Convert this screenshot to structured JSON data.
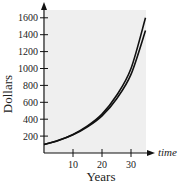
{
  "chart_data": {
    "type": "line",
    "title": "",
    "xlabel": "Years",
    "ylabel": "Dollars",
    "x_axis_arrow_label": "time",
    "xlim": [
      0,
      35
    ],
    "ylim": [
      0,
      1700
    ],
    "x_ticks": [
      10,
      20,
      30
    ],
    "y_ticks": [
      200,
      400,
      600,
      800,
      1000,
      1200,
      1400,
      1600
    ],
    "grid": false,
    "background_panel": "#efefef",
    "series": [
      {
        "name": "upper curve",
        "x": [
          0,
          5,
          10,
          15,
          20,
          25,
          30,
          35
        ],
        "values": [
          100,
          150,
          220,
          320,
          460,
          680,
          1000,
          1600
        ]
      },
      {
        "name": "lower curve",
        "x": [
          0,
          5,
          10,
          15,
          20,
          25,
          30,
          35
        ],
        "values": [
          100,
          148,
          215,
          310,
          440,
          640,
          930,
          1450
        ]
      }
    ]
  },
  "labels": {
    "xlabel": "Years",
    "ylabel": "Dollars",
    "time": "time",
    "x_ticks": [
      "10",
      "20",
      "30"
    ],
    "y_ticks": [
      "200",
      "400",
      "600",
      "800",
      "1000",
      "1200",
      "1400",
      "1600"
    ]
  }
}
